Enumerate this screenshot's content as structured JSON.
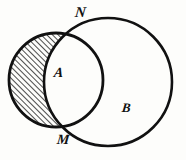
{
  "figure": {
    "background_color": "#fdfdfb",
    "stroke_color": "#111111",
    "hatch_color": "#111111"
  },
  "labels": {
    "top_intersection": "N",
    "bottom_intersection": "M",
    "left_set": "A",
    "right_set": "B"
  },
  "chart_data": {
    "type": "diagram",
    "diagram_kind": "venn-two-set",
    "shaded_region": "A \\ B",
    "shading_style": "diagonal-hatch",
    "shading_angle_deg": 45,
    "shading_spacing_px": 4,
    "sets": [
      {
        "name": "A",
        "label": "A",
        "center_x": 56,
        "center_y": 80,
        "radius": 47,
        "fill": "none",
        "stroke": "#111111",
        "stroke_width": 2.6
      },
      {
        "name": "B",
        "label": "B",
        "center_x": 108,
        "center_y": 82,
        "radius": 64,
        "fill": "none",
        "stroke": "#111111",
        "stroke_width": 2.6
      }
    ],
    "intersection_points": [
      {
        "label": "N",
        "x": 80,
        "y": 26
      },
      {
        "label": "M",
        "x": 71,
        "y": 130
      }
    ],
    "xlim": [
      0,
      186
    ],
    "ylim": [
      0,
      160
    ],
    "grid": false,
    "legend": false
  }
}
